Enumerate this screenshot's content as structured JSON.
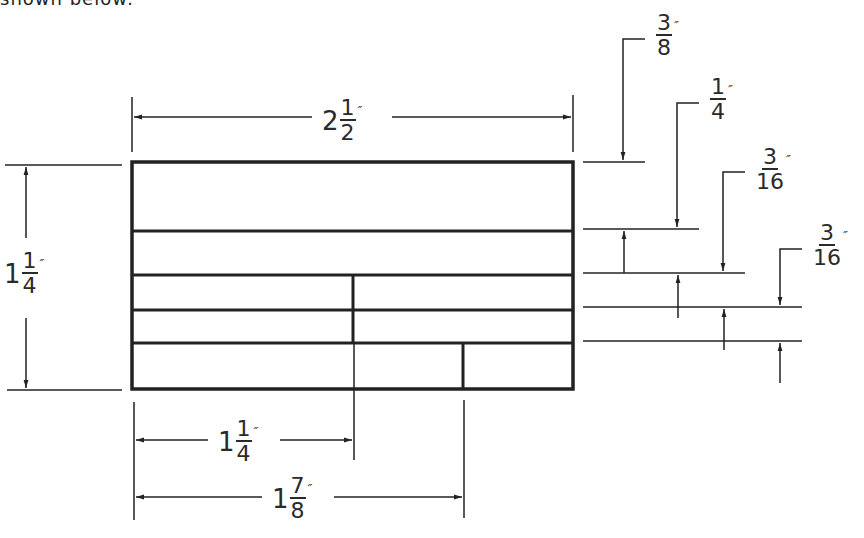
{
  "header_fragment": "shown below:",
  "drawing": {
    "type": "dimensioned title-block layout",
    "overall_width": {
      "whole": "2",
      "num": "1",
      "den": "2",
      "unit": "″"
    },
    "overall_height": {
      "whole": "1",
      "num": "1",
      "den": "4",
      "unit": "″"
    },
    "divider_1_offset": {
      "whole": "1",
      "num": "1",
      "den": "4",
      "unit": "″"
    },
    "divider_2_offset": {
      "whole": "1",
      "num": "7",
      "den": "8",
      "unit": "″"
    },
    "row_heights": [
      {
        "whole": "",
        "num": "3",
        "den": "8",
        "unit": "″"
      },
      {
        "whole": "",
        "num": "1",
        "den": "4",
        "unit": "″"
      },
      {
        "whole": "",
        "num": "3",
        "den": "16",
        "unit": "″"
      },
      {
        "whole": "",
        "num": "3",
        "den": "16",
        "unit": "″"
      }
    ],
    "line_color": "#222222"
  }
}
